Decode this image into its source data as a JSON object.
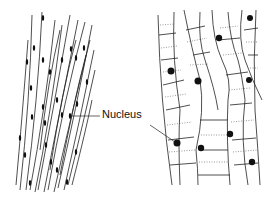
{
  "diagram": {
    "labels": {
      "nucleus": "Nucleus"
    },
    "panels": [
      {
        "name": "smooth-muscle-tissue",
        "description": "spindle-shaped cells with single central nucleus"
      },
      {
        "name": "cardiac-muscle-tissue",
        "description": "branched striated cells with central nuclei"
      }
    ],
    "colors": {
      "line": "#222222",
      "nucleus": "#111111",
      "background": "#ffffff"
    }
  }
}
